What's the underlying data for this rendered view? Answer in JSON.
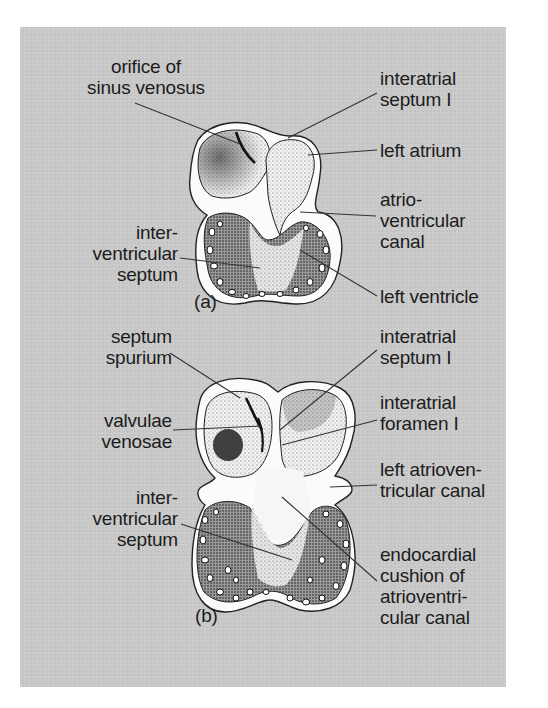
{
  "figure": {
    "background_color": "#c9c9c9",
    "label_color": "#1c1c1c",
    "panels": [
      {
        "id": "a",
        "caption": "(a)",
        "labels": {
          "orifice_sinus_venosus": "orifice of\nsinus venosus",
          "interatrial_septum": "interatrial\nseptum I",
          "left_atrium": "left atrium",
          "atrioventricular_canal": "atrio-\nventricular\ncanal",
          "interventricular_septum": "inter-\nventricular\nseptum",
          "left_ventricle": "left ventricle"
        }
      },
      {
        "id": "b",
        "caption": "(b)",
        "labels": {
          "septum_spurium": "septum\nspurium",
          "valvulae_venosae": "valvulae\nvenosae",
          "interatrial_septum": "interatrial\nseptum I",
          "interatrial_foramen": "interatrial\nforamen I",
          "left_av_canal": "left atrioven-\ntricular canal",
          "interventricular_septum": "inter-\nventricular\nseptum",
          "endocardial_cushion": "endocardial\ncushion of\natrioventri-\ncular canal"
        }
      }
    ]
  }
}
